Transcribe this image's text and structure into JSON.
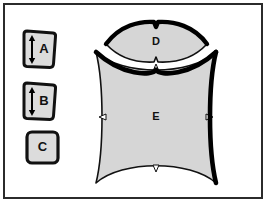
{
  "figure": {
    "background_color": "#ffffff",
    "frame": {
      "name": "outer-border",
      "color": "#2b2b2b",
      "thickness_px": 2
    },
    "palette": {
      "shape_fill": "#d6d6d6",
      "shape_fill_tiles": "#dcdcdc",
      "outline_thin": "#1a1a1a",
      "outline_heavy": "#000000",
      "label_color": "#111111",
      "arrow_color": "#000000"
    }
  },
  "tiles": [
    {
      "id": "tile-a",
      "label": "A",
      "icon": "double-headed-vertical-arrow-icon",
      "shape": "rounded-trapezoid",
      "fill": "#dcdcdc",
      "position": {
        "x": 22,
        "y": 31,
        "width": 34,
        "height": 38
      }
    },
    {
      "id": "tile-b",
      "label": "B",
      "icon": "double-headed-vertical-arrow-icon",
      "shape": "rounded-trapezoid",
      "fill": "#dcdcdc",
      "position": {
        "x": 22,
        "y": 83,
        "width": 34,
        "height": 38
      }
    },
    {
      "id": "tile-c",
      "label": "C",
      "icon": "none",
      "shape": "rounded-square",
      "fill": "#dcdcdc",
      "position": {
        "x": 26,
        "y": 131,
        "width": 32,
        "height": 32
      }
    }
  ],
  "regions": [
    {
      "id": "region-d",
      "label": "D",
      "shape": "lens-vesica-with-notches",
      "fill": "#d6d6d6",
      "label_position": {
        "x": 156,
        "y": 40
      },
      "notches": [
        "top-center",
        "bottom-center"
      ],
      "heavy_stroke_edges": [
        "upper-arc",
        "lower-arc-left"
      ]
    },
    {
      "id": "region-e",
      "label": "E",
      "shape": "concave-sided-square-astroid",
      "fill": "#d6d6d6",
      "label_position": {
        "x": 156,
        "y": 117
      },
      "notches": [
        "top-center",
        "left-center",
        "right-center",
        "bottom-center"
      ],
      "heavy_stroke_edges": [
        "top-arc",
        "right-arc"
      ]
    }
  ]
}
